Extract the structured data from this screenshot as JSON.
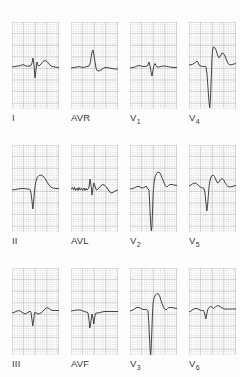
{
  "figure": {
    "name": "twelve-lead-ecg",
    "background_color": "#fdfdfd",
    "paper_color": "#ffffff",
    "grid_major_color": "#96969e",
    "grid_minor_color": "#b0b0b8",
    "trace_color": "#3b3b3f",
    "rows": 3,
    "columns": 4
  },
  "leads": [
    {
      "label": "I",
      "label_base": "I",
      "label_sub": "",
      "row": 0,
      "col": 0,
      "description": "small positive R with narrow sharp QS deflection, flat low-amplitude baseline",
      "path": "M0,45 L3,44.5 L6,44 L9,43.5 L11,42.5 L13,43.5 L15,44.2 L17,44 L19,43.6 L20,41 L21,36 L22,43 L23,56 L24,48 L25,40 L26,43.5 L27,44 L29,42 L31,39.5 L33,38.5 L35,39.5 L37,42 L39,44 L42,45 L47,45.5"
    },
    {
      "label": "AVR",
      "label_base": "AVR",
      "label_sub": "",
      "row": 0,
      "col": 1,
      "description": "flat baseline with upright narrow R spike and slight negative deflection after",
      "path": "M0,46 L3,45.5 L6,45 L8,44.5 L10,45 L12,45.5 L14,45 L16,44.5 L18,44 L19,42 L20,36 L21,30 L22,28 L23,33 L24,40 L25,46 L26,48.5 L28,49 L30,48 L32,46.5 L34,45.5 L36,45.5 L38,46 L41,46.5 L44,47 L47,47"
    },
    {
      "label": "V1",
      "label_base": "V",
      "label_sub": "1",
      "row": 0,
      "col": 2,
      "description": "isoelectric low-amplitude complex with small rS and narrow downward spike",
      "path": "M0,46 L3,45.5 L5,45 L7,44 L9,43.5 L11,44 L13,44.5 L15,44.5 L17,44 L18,43 L19,40 L20,44 L21,50 L22,54 L23,48 L24,43.5 L25,41.5 L26,43.5 L27,45 L29,45 L31,44.5 L33,44 L35,44 L37,44.5 L40,45 L43,45.5 L47,45.5"
    },
    {
      "label": "V4",
      "label_base": "V",
      "label_sub": "4",
      "row": 0,
      "col": 3,
      "description": "deep wide QS descending off panel with tall R and broad biphasic T wave",
      "path": "M0,43 L3,42.5 L5,41.5 L7,40 L8,39 L9,40.5 L10,43 L12,44 L14,44.5 L16,44.5 L17,45 L18,52 L19,66 L20,80 L20.7,86 L21.4,78 L22,62 L22.6,48 L23,36 L23.6,28 L24.4,25 L25.5,25.5 L27,28 L28.5,33 L30,36 L31.5,34 L33,31 L34.5,31.5 L36,34 L37.5,38 L39,41.5 L41,43 L43,42.5 L45,42 L47,41.5"
    },
    {
      "label": "II",
      "label_base": "II",
      "label_sub": "",
      "row": 1,
      "col": 0,
      "description": "low flat baseline, narrow deep Q/S spike then broad rounded R hump",
      "path": "M0,45 L3,44.5 L6,44 L9,43.5 L12,43.5 L15,44 L17,44 L18,44.5 L19,48 L20,56 L20.8,64 L21.5,58 L22.2,50 L23,42 L24,36 L25.5,32 L27,30.5 L29,30 L31,31 L33,33.5 L35,37 L37,40 L39,42 L41,43 L44,43.5 L47,43.5"
    },
    {
      "label": "AVL",
      "label_base": "AVL",
      "label_sub": "",
      "row": 1,
      "col": 1,
      "description": "jagged noisy baseline with sharp narrow RS complex and small T wave",
      "path": "M0,44 L1.5,42.5 L2.5,45 L3.5,42 L4.5,45.5 L6,43 L7,45.5 L8,42.5 L9,45 L10.5,43 L11.5,45.5 L13,43 L14,45.5 L15,43.5 L16,45 L17,44 L18,42 L19,34 L20,40 L21,50 L22,43 L23,38 L24,41 L25,44.5 L26,45 L28,43 L30,40.5 L32,39.5 L34,40.5 L36,43 L38,46 L40,48 L42,47.5 L44,46 L47,45"
    },
    {
      "label": "V2",
      "label_base": "V",
      "label_sub": "2",
      "row": 1,
      "col": 2,
      "description": "very deep narrow S wave reaching panel bottom, tall positive T wave after",
      "path": "M0,44 L3,43.5 L5,42.5 L7,41.5 L9,41.5 L11,42.5 L13,43 L15,42 L16,41 L17,42.5 L18,44 L19,45 L19.6,56 L20.2,70 L20.8,80 L21.4,86 L22,80 L22.6,64 L23.2,48 L24,38 L25,32 L26.5,28.5 L28,27 L29.5,27.5 L31,30 L32.5,34 L34,38 L35.5,41 L37,42 L38.5,40.5 L40,39.5 L42,39.5 L44,40 L47,40.5"
    },
    {
      "label": "V5",
      "label_base": "V",
      "label_sub": "5",
      "row": 1,
      "col": 3,
      "description": "deep narrow Q/S dip followed by broad positive R and T complex",
      "path": "M0,41 L2,40 L4,38.5 L6,38 L8,39 L10,41 L12,42.5 L14,43 L15,43.5 L16,48 L17,58 L17.8,66 L18.6,60 L19.4,50 L20,42 L21,35 L22.5,31 L24,30 L25.5,31.5 L27,35 L28.5,38 L30,37 L31.5,34.5 L33,33.5 L34.5,34.5 L36,37.5 L38,40.5 L40,42 L43,41.5 L47,40.5"
    },
    {
      "label": "III",
      "label_base": "III",
      "label_sub": "",
      "row": 2,
      "col": 0,
      "description": "low amplitude wandering baseline with small sharp S and late positive bump",
      "path": "M0,45 L3,44 L5,43 L7,42.5 L9,43.5 L11,45 L13,46 L15,45 L17,44 L18,43 L19,44.5 L20,52 L20.8,58 L21.6,52 L22.4,46 L23,44 L25,45.5 L27,46 L29,45 L31,43 L33,41 L35,39.5 L37,40.5 L39,42 L41,42.5 L44,42.5 L47,42.5"
    },
    {
      "label": "AVF",
      "label_base": "AVF",
      "label_sub": "",
      "row": 2,
      "col": 1,
      "description": "flat baseline, narrow deep QS spike then slowly recovering low segment",
      "path": "M0,43 L3,42.5 L6,42 L9,42 L11,42.5 L13,43.5 L15,44 L16,44 L17,45 L18,52 L18.8,60 L19.6,56 L20.4,50 L21,46 L22,50 L22.8,56 L23.6,50 L24.4,46 L25,45 L27,45 L29,44.5 L31,44 L33,43.5 L35,43.5 L38,43.5 L41,43.5 L44,43.5 L47,43.5"
    },
    {
      "label": "V3",
      "label_base": "V",
      "label_sub": "3",
      "row": 2,
      "col": 2,
      "description": "extremely deep narrow S wave running to panel bottom with tall broad R and T",
      "path": "M0,43 L3,42 L5,40.5 L7,39.5 L9,39.5 L11,40.5 L13,41.5 L15,41.5 L16,41 L17,42 L18,43 L18.8,55 L19.5,70 L20.1,82 L20.6,87 L21.2,80 L21.8,64 L22.4,48 L23,36 L24,30 L25.5,27 L27,25.5 L28.5,26 L30,29 L31.5,34 L33,38 L34.5,41 L36,42 L37.5,40.5 L39,39.5 L41,39.5 L44,40 L47,40.5"
    },
    {
      "label": "V6",
      "label_base": "V",
      "label_sub": "6",
      "row": 2,
      "col": 3,
      "description": "small narrow S notch with low rounded R and T humps on a flat baseline",
      "path": "M0,44 L2,43 L4,41.5 L6,40.5 L8,40.5 L10,41.5 L12,42.5 L13,43 L14,42 L15,43.5 L16,47 L16.8,51 L17.6,47 L18.4,43 L19,41 L20,39.5 L21.5,38.5 L23,39 L24.5,40.5 L26,39.5 L27.5,38 L29,37.5 L31,38.5 L33,40 L35,41 L38,41 L41,41 L44,41 L47,41"
    }
  ]
}
